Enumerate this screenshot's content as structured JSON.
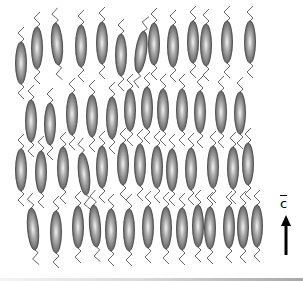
{
  "figure": {
    "director_label": "c",
    "director_arrow": {
      "x": 286,
      "y_top": 215,
      "y_bottom": 255
    },
    "colors": {
      "molecule_edge": "#3a3a3a",
      "molecule_dark": "#5a5a5a",
      "molecule_light": "#f0f0f0",
      "tail": "#555555",
      "arrow": "#000000"
    },
    "molecule_size": {
      "rx": 5.5,
      "ry": 21
    },
    "layers": [
      {
        "name": "layer-1",
        "molecules": [
          {
            "x": 21,
            "y": 63,
            "tilt": 0
          },
          {
            "x": 37,
            "y": 48,
            "tilt": 0
          },
          {
            "x": 57,
            "y": 44,
            "tilt": -4
          },
          {
            "x": 81,
            "y": 46,
            "tilt": 0
          },
          {
            "x": 102,
            "y": 43,
            "tilt": 0
          },
          {
            "x": 121,
            "y": 55,
            "tilt": 0
          },
          {
            "x": 141,
            "y": 52,
            "tilt": 8
          },
          {
            "x": 154,
            "y": 44,
            "tilt": 0
          },
          {
            "x": 173,
            "y": 46,
            "tilt": 0
          },
          {
            "x": 193,
            "y": 42,
            "tilt": 0
          },
          {
            "x": 206,
            "y": 45,
            "tilt": 0
          },
          {
            "x": 227,
            "y": 42,
            "tilt": 0
          },
          {
            "x": 250,
            "y": 42,
            "tilt": 0
          }
        ]
      },
      {
        "name": "layer-2",
        "molecules": [
          {
            "x": 31,
            "y": 121,
            "tilt": 0
          },
          {
            "x": 50,
            "y": 124,
            "tilt": 0
          },
          {
            "x": 72,
            "y": 114,
            "tilt": 0
          },
          {
            "x": 92,
            "y": 116,
            "tilt": 0
          },
          {
            "x": 112,
            "y": 118,
            "tilt": 0
          },
          {
            "x": 130,
            "y": 110,
            "tilt": 0
          },
          {
            "x": 147,
            "y": 108,
            "tilt": 0
          },
          {
            "x": 163,
            "y": 110,
            "tilt": 0
          },
          {
            "x": 182,
            "y": 110,
            "tilt": 0
          },
          {
            "x": 200,
            "y": 112,
            "tilt": 0
          },
          {
            "x": 221,
            "y": 112,
            "tilt": 0
          },
          {
            "x": 240,
            "y": 113,
            "tilt": 0
          }
        ]
      },
      {
        "name": "layer-3",
        "molecules": [
          {
            "x": 21,
            "y": 170,
            "tilt": 0
          },
          {
            "x": 41,
            "y": 172,
            "tilt": 0
          },
          {
            "x": 63,
            "y": 168,
            "tilt": 0
          },
          {
            "x": 84,
            "y": 174,
            "tilt": -6
          },
          {
            "x": 102,
            "y": 167,
            "tilt": 0
          },
          {
            "x": 123,
            "y": 164,
            "tilt": 0
          },
          {
            "x": 140,
            "y": 165,
            "tilt": 0
          },
          {
            "x": 157,
            "y": 167,
            "tilt": 0
          },
          {
            "x": 172,
            "y": 170,
            "tilt": 0
          },
          {
            "x": 191,
            "y": 169,
            "tilt": 0
          },
          {
            "x": 213,
            "y": 167,
            "tilt": 0
          },
          {
            "x": 233,
            "y": 168,
            "tilt": 0
          },
          {
            "x": 248,
            "y": 164,
            "tilt": 0
          }
        ]
      },
      {
        "name": "layer-4",
        "molecules": [
          {
            "x": 33,
            "y": 229,
            "tilt": -5
          },
          {
            "x": 56,
            "y": 232,
            "tilt": 0
          },
          {
            "x": 78,
            "y": 227,
            "tilt": 0
          },
          {
            "x": 95,
            "y": 226,
            "tilt": -4
          },
          {
            "x": 111,
            "y": 230,
            "tilt": 0
          },
          {
            "x": 129,
            "y": 230,
            "tilt": 0
          },
          {
            "x": 148,
            "y": 227,
            "tilt": 0
          },
          {
            "x": 166,
            "y": 228,
            "tilt": 0
          },
          {
            "x": 182,
            "y": 229,
            "tilt": 0
          },
          {
            "x": 198,
            "y": 226,
            "tilt": 0
          },
          {
            "x": 210,
            "y": 228,
            "tilt": 0
          },
          {
            "x": 229,
            "y": 227,
            "tilt": 0
          },
          {
            "x": 243,
            "y": 227,
            "tilt": 0
          },
          {
            "x": 257,
            "y": 226,
            "tilt": 0
          }
        ]
      }
    ]
  }
}
